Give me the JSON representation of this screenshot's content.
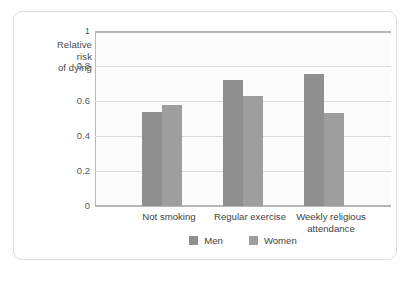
{
  "chart_data": {
    "type": "bar",
    "title": "",
    "subtitle": "",
    "xlabel": "",
    "ylabel": "Relative risk of dying",
    "ylabel_lines": [
      "Relative",
      "risk",
      "of dying"
    ],
    "categories": [
      "Not smoking",
      "Regular exercise",
      "Weekly religious attendance"
    ],
    "category_label_lines": [
      [
        "Not smoking"
      ],
      [
        "Regular exercise"
      ],
      [
        "Weekly religious",
        "attendance"
      ]
    ],
    "series": [
      {
        "name": "Men",
        "values": [
          0.54,
          0.72,
          0.755
        ],
        "color": "#8f8f8f"
      },
      {
        "name": "Women",
        "values": [
          0.58,
          0.63,
          0.53
        ],
        "color": "#9e9e9e"
      }
    ],
    "ylim": [
      0,
      1
    ],
    "yticks": [
      0,
      0.2,
      0.4,
      0.6,
      0.8,
      1
    ],
    "ytick_labels": [
      "0",
      "0.2",
      "0.4",
      "0.6",
      "0.8",
      "1"
    ],
    "grid": true,
    "grid_axis": "y",
    "legend_position": "bottom",
    "legend": [
      "Men",
      "Women"
    ]
  },
  "colors": {
    "men": "#8f8f8f",
    "women": "#9e9e9e",
    "gridline": "#d9d9d9",
    "axis": "#b6b6b6",
    "card_border": "#dedede",
    "plot_background": "#fcfcfc",
    "page_background": "#ffffff",
    "text": "#3f3f3f"
  }
}
